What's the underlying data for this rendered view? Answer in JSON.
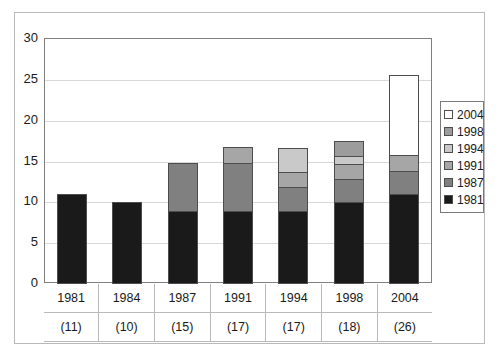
{
  "chart_data": {
    "type": "bar",
    "stacked": true,
    "title": "",
    "xlabel": "",
    "ylabel": "",
    "ylim": [
      0,
      30
    ],
    "yticks": [
      0,
      5,
      10,
      15,
      20,
      25,
      30
    ],
    "grid": true,
    "legend_position": "right",
    "categories": [
      "1981",
      "1984",
      "1987",
      "1991",
      "1994",
      "1998",
      "2004"
    ],
    "category_counts": [
      "(11)",
      "(10)",
      "(15)",
      "(17)",
      "(17)",
      "(18)",
      "(26)"
    ],
    "totals": [
      11,
      10,
      15,
      17,
      17,
      18,
      26
    ],
    "series": [
      {
        "name": "1981",
        "color": "#1a1a1a",
        "values": [
          11,
          10,
          9,
          9,
          9,
          10,
          11
        ]
      },
      {
        "name": "1987",
        "color": "#808080",
        "values": [
          0,
          0,
          6,
          6,
          3,
          3,
          3
        ]
      },
      {
        "name": "1991",
        "color": "#a6a6a6",
        "values": [
          0,
          0,
          0,
          2,
          2,
          2,
          2
        ]
      },
      {
        "name": "1994",
        "color": "#c9c9c9",
        "values": [
          0,
          0,
          0,
          0,
          3,
          1,
          0
        ]
      },
      {
        "name": "1998",
        "color": "#9c9c9c",
        "values": [
          0,
          0,
          0,
          0,
          0,
          2,
          0
        ]
      },
      {
        "name": "2004",
        "color": "#ffffff",
        "values": [
          0,
          0,
          0,
          0,
          0,
          0,
          10
        ]
      }
    ],
    "legend_entries": [
      {
        "label": "2004",
        "color": "#ffffff"
      },
      {
        "label": "1998",
        "color": "#9c9c9c"
      },
      {
        "label": "1994",
        "color": "#c9c9c9"
      },
      {
        "label": "1991",
        "color": "#a6a6a6"
      },
      {
        "label": "1987",
        "color": "#808080"
      },
      {
        "label": "1981",
        "color": "#1a1a1a"
      }
    ]
  }
}
